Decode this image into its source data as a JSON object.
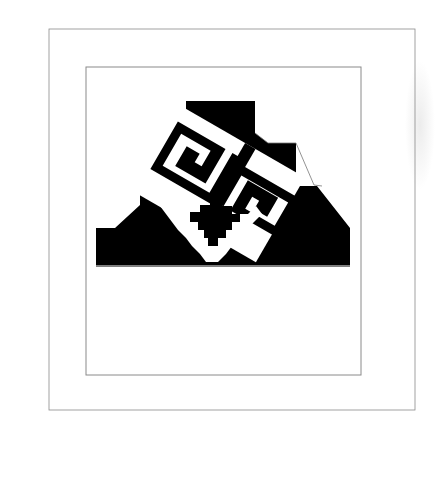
{
  "artwork": {
    "title": "",
    "description": "Stepped pyramid with stylized fret face inside a Greek key border, above a wave band of spirals",
    "colors": {
      "background": "#ffffff",
      "ink": "#000000",
      "line": "#6e6e6e",
      "frame": "#8a8a8a"
    },
    "border": {
      "pattern": "greek-key-meander"
    },
    "pyramid": {
      "style": "stepped",
      "fill": "black",
      "inner_motif": "double-fret-scroll-with-stepped-diamond"
    },
    "wave_band": {
      "strands": 4,
      "large_spirals": 7,
      "small_solid_spirals": 4,
      "shell_pendants": 4
    }
  }
}
